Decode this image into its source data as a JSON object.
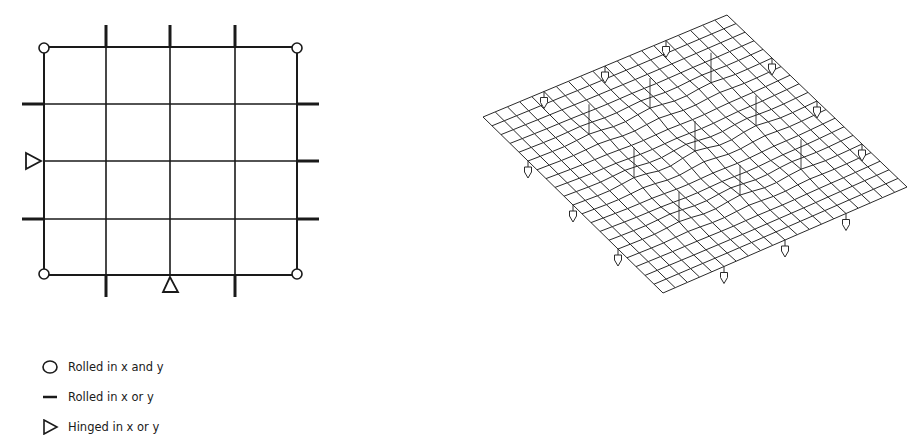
{
  "figure": {
    "plan": {
      "grid_divisions": 4,
      "supports": {
        "corners": "rolled-xy",
        "edge_ticks": "rolled-x-or-y",
        "hinges": [
          "left-middle",
          "bottom-middle"
        ]
      }
    },
    "mesh_view": {
      "description": "Deformed shell mesh (isometric) with point supports",
      "mesh_divisions": 20
    },
    "legend": [
      {
        "symbol": "circle-icon",
        "label": "Rolled in x and y"
      },
      {
        "symbol": "dash-icon",
        "label": "Rolled in x or y"
      },
      {
        "symbol": "triangle-icon",
        "label": "Hinged in x or y"
      }
    ],
    "colors": {
      "ink": "#1a1a1a",
      "mesh": "#2a2a2a",
      "background": "#ffffff"
    }
  }
}
